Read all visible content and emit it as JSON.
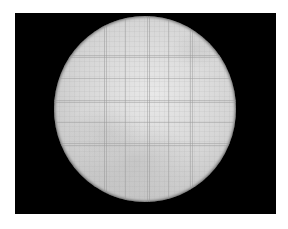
{
  "image": {
    "subject": "microscope field of view of a counting chamber grid",
    "description": "Circular bright field of view with faint ruled grid lines on a black background",
    "colors": {
      "background": "#ffffff",
      "frame": "#000000",
      "field_light": "#e8e8e8",
      "field_edge": "#c8c8c8",
      "grid_line": "#969696"
    },
    "grid": {
      "vertical_lines_x": [
        50,
        71,
        93,
        114,
        136
      ],
      "horizontal_lines_y": [
        39,
        62,
        84,
        106,
        127
      ]
    }
  }
}
